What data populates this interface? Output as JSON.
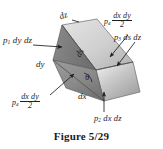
{
  "figure": {
    "caption": "Figure 5/29",
    "title_symbols": {
      "dz_top": "dz",
      "ds_center": "ds",
      "dy_left": "dy",
      "dx_bottom": "dx",
      "theta": "θ"
    },
    "labels": [
      {
        "id": "p1-face-force",
        "p": "p",
        "sub": "1",
        "rest": "dy dz",
        "type": "plain"
      },
      {
        "id": "p4-top-force",
        "p": "p",
        "sub": "4",
        "num": "dx dy",
        "den": "2",
        "type": "fraction"
      },
      {
        "id": "p3-inclined-force",
        "p": "p",
        "sub": "3",
        "rest": "ds dz",
        "type": "plain"
      },
      {
        "id": "p4-bottom-force",
        "p": "p",
        "sub": "4",
        "num": "dx dy",
        "den": "2",
        "type": "fraction"
      },
      {
        "id": "p2-base-force",
        "p": "p",
        "sub": "2",
        "rest": "dx dz",
        "type": "plain"
      }
    ],
    "colors": {
      "background": "#ffffff",
      "ink": "#1e1e1e",
      "face_top_light": "#d9d9d9",
      "face_incline": "#bdbdbd",
      "face_front_dark": "#8f8f8f",
      "face_side": "#a8a8a8",
      "edge": "#5a5a5a"
    }
  }
}
